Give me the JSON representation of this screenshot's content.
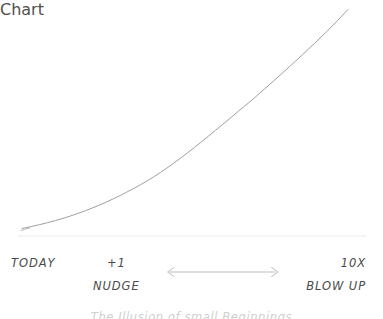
{
  "figure": {
    "background_color": "#ffffff",
    "width": 383,
    "height": 319,
    "baseline": {
      "name": "baseline-rule",
      "color": "#f2f2f4",
      "y": 236,
      "x_start": 18,
      "x_end": 366
    },
    "curve": {
      "name": "exponential-growth-curve",
      "color": "#9a9a9e",
      "stroke_width": 0.9,
      "style": "hand-drawn thin pencil line",
      "start_point": [
        22,
        228
      ],
      "end_point": [
        348,
        9
      ],
      "sampled_points": [
        [
          22,
          228
        ],
        [
          60,
          214
        ],
        [
          90,
          203
        ],
        [
          120,
          192
        ],
        [
          150,
          175
        ],
        [
          185,
          150
        ],
        [
          215,
          128
        ],
        [
          250,
          102
        ],
        [
          290,
          75
        ],
        [
          320,
          42
        ],
        [
          348,
          9
        ]
      ]
    },
    "arrow": {
      "name": "range-span-arrow",
      "color": "#b4b4b8",
      "x_start": 167,
      "x_end": 278,
      "y": 272,
      "double_headed": true
    }
  },
  "labels": {
    "today": "TODAY",
    "plus_one": "+1",
    "nudge": "NUDGE",
    "ten_x": "10X",
    "blow_up": "BLOW UP"
  },
  "bottom_caption": {
    "text": "The Illusion of small Beginnings",
    "note": "clipped at the bottom edge of the screenshot"
  },
  "chart_data": {
    "type": "line",
    "title": "",
    "xlabel": "",
    "ylabel": "",
    "grid": false,
    "legend": null,
    "axis_tick_labels": [
      "TODAY",
      "+1",
      "10X"
    ],
    "annotations": [
      "NUDGE",
      "BLOW UP"
    ],
    "series": [
      {
        "name": "compounding-growth",
        "x": [
          0,
          0.12,
          0.21,
          0.3,
          0.39,
          0.5,
          0.59,
          0.7,
          0.82,
          0.91,
          1.0
        ],
        "y": [
          0.03,
          0.09,
          0.14,
          0.19,
          0.27,
          0.39,
          0.49,
          0.61,
          0.73,
          0.88,
          1.0
        ]
      }
    ],
    "xlim": [
      0,
      1
    ],
    "ylim": [
      0,
      1
    ]
  }
}
